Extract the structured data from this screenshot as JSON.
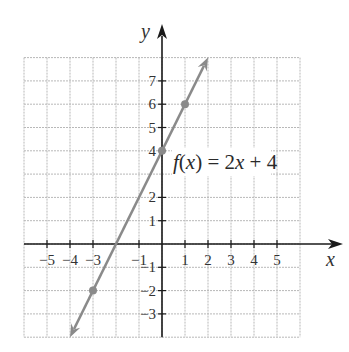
{
  "chart_data": {
    "type": "line",
    "title": "",
    "function_label": "f(x) = 2x + 4",
    "function_label_parts": [
      "f",
      "(",
      "x",
      ") = 2",
      "x",
      " + 4"
    ],
    "xlabel": "x",
    "ylabel": "y",
    "xlim": [
      -6,
      6
    ],
    "ylim": [
      -4,
      8
    ],
    "grid": true,
    "x_tick_labels": [
      "−5",
      "−4",
      "−3",
      "−1",
      "1",
      "2",
      "3",
      "4",
      "5"
    ],
    "x_tick_values": [
      -5,
      -4,
      -3,
      -1,
      1,
      2,
      3,
      4,
      5
    ],
    "y_tick_labels": [
      "7",
      "6",
      "5",
      "4",
      "2",
      "1",
      "−1",
      "−2",
      "−3"
    ],
    "y_tick_values": [
      7,
      6,
      5,
      4,
      2,
      1,
      -1,
      -2,
      -3
    ],
    "series": [
      {
        "name": "f(x) = 2x + 4",
        "slope": 2,
        "intercept": 4,
        "line_endpoints": [
          [
            -4,
            -4
          ],
          [
            2,
            8
          ]
        ],
        "marked_points": [
          [
            -3,
            -2
          ],
          [
            0,
            4
          ],
          [
            1,
            6
          ]
        ],
        "arrows_both_ends": true,
        "color": "#8a8a8a"
      }
    ]
  }
}
